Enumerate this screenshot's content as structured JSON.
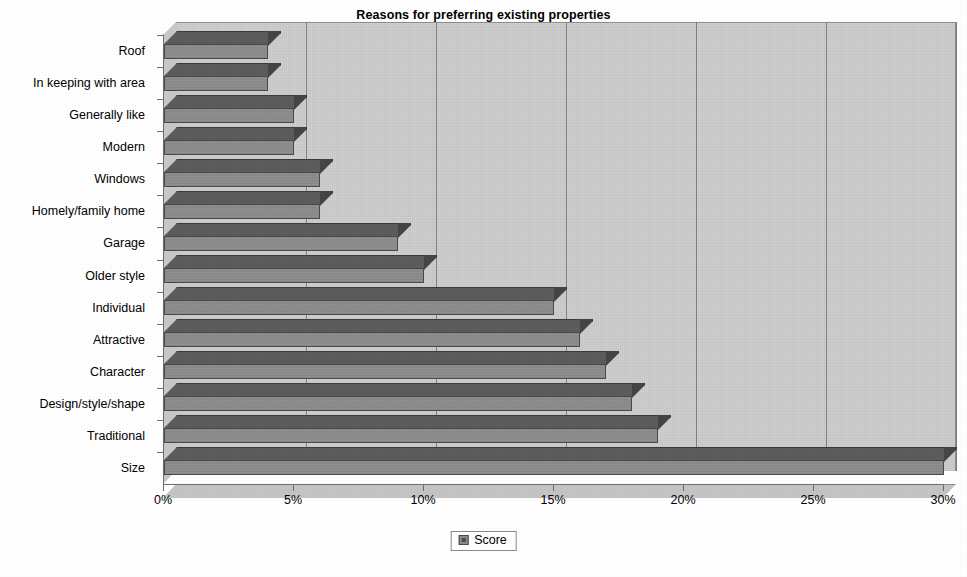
{
  "chart_data": {
    "type": "bar",
    "orientation": "horizontal",
    "title": "Reasons for preferring existing properties",
    "xlabel": "",
    "ylabel": "",
    "xlim": [
      0,
      30
    ],
    "xtick_labels": [
      "0%",
      "5%",
      "10%",
      "15%",
      "20%",
      "25%",
      "30%"
    ],
    "xtick_values": [
      0,
      5,
      10,
      15,
      20,
      25,
      30
    ],
    "grid": "vertical",
    "legend": {
      "position": "bottom-center",
      "entries": [
        "Score"
      ]
    },
    "categories": [
      "Size",
      "Traditional",
      "Design/style/shape",
      "Character",
      "Attractive",
      "Individual",
      "Older style",
      "Garage",
      "Homely/family home",
      "Windows",
      "Modern",
      "Generally like",
      "In keeping with area",
      "Roof"
    ],
    "series": [
      {
        "name": "Score",
        "values": [
          30,
          19,
          18,
          17,
          16,
          15,
          10,
          9,
          6,
          6,
          5,
          5,
          4,
          4
        ],
        "unit": "%",
        "color": "#8c8c8c"
      }
    ],
    "axis_note": "Categories listed bottom-to-top as drawn; 'Size' is the longest bar reaching 30%."
  },
  "colors": {
    "bar_face": "#8c8c8c",
    "bar_top": "#5c5c5c",
    "bar_side": "#454545",
    "plot_background": "#cfcfcf",
    "gridline": "#7f7f7f",
    "axis": "#6e6e6e",
    "text": "#000000",
    "page_background": "#ffffff"
  },
  "legend_box": {
    "swatch_icon": "square-swatch-icon",
    "label": "Score"
  }
}
